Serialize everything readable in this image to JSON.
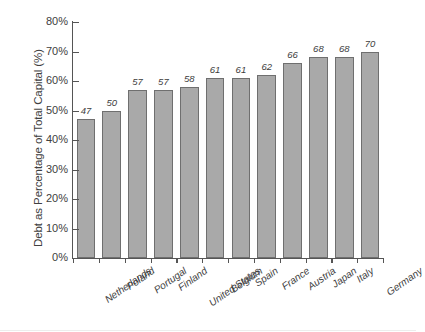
{
  "chart_data": {
    "type": "bar",
    "title": "",
    "subtitle": "",
    "xlabel": "",
    "ylabel": "Debt as Percentage of Total Capital (%)",
    "ylim": [
      0,
      80
    ],
    "ytick_step": 10,
    "ytick_labels": [
      "80%",
      "70%",
      "60%",
      "50%",
      "40%",
      "30%",
      "20%",
      "10%",
      "0%"
    ],
    "ytick_values": [
      80,
      70,
      60,
      50,
      40,
      30,
      20,
      10,
      0
    ],
    "grid": false,
    "legend": "none",
    "value_labels_shown": true,
    "categories": [
      "Netherlands",
      "Poland",
      "Portugal",
      "Finland",
      "United States",
      "Belgium",
      "Spain",
      "France",
      "Austria",
      "Japan",
      "Italy",
      "Germany"
    ],
    "values": [
      47,
      50,
      57,
      57,
      58,
      61,
      61,
      62,
      66,
      68,
      68,
      70
    ],
    "value_label_texts": [
      "47",
      "50",
      "57",
      "57",
      "58",
      "61",
      "61",
      "62",
      "66",
      "68",
      "68",
      "70"
    ],
    "colors": {
      "bar_fill": "#a9a9a9",
      "bar_stroke": "#6f6f6f",
      "axis": "#555555",
      "text": "#3d3d3d",
      "background": "#ffffff"
    }
  }
}
